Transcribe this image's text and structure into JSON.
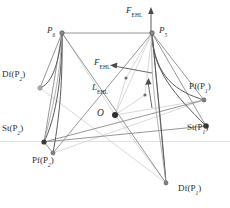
{
  "figure": {
    "type": "geometric-kinematic-diagram",
    "background": "#ffffff",
    "stroke_dark": "#4a4a4a",
    "stroke_mid": "#7d7d7d",
    "stroke_light": "#b9b9b9",
    "stroke_faint": "#d8d8d8",
    "node_fill": "#3b3b3b",
    "node_fill_light": "#9a9a9a",
    "text_color": "#2e2e2e"
  },
  "labels": {
    "f_ehl_top": {
      "base": "F",
      "sub": "EHL",
      "x": 126,
      "y": 8
    },
    "f_ehl_center": {
      "base": "F",
      "sub": "EHL",
      "x": 95,
      "y": 60
    },
    "l_ehl": {
      "base": "L",
      "sub": "EHL",
      "x": 93,
      "y": 85
    },
    "origin": {
      "base": "O",
      "sub": "",
      "x": 98,
      "y": 111
    },
    "p6": {
      "base": "P",
      "sub": "6",
      "x": 48,
      "y": 29
    },
    "p5": {
      "base": "P",
      "sub": "5",
      "x": 160,
      "y": 29
    },
    "df_p2": {
      "base": "Df(P",
      "sub": "2",
      "tail": ")",
      "x": 3,
      "y": 73
    },
    "st_p2": {
      "base": "St(P",
      "sub": "2",
      "tail": ")",
      "x": 3,
      "y": 127
    },
    "pf_p2": {
      "base": "Pf(P",
      "sub": "2",
      "tail": ")",
      "x": 33,
      "y": 158
    },
    "pf_p1": {
      "base": "Pf(P",
      "sub": "1",
      "tail": ")",
      "x": 190,
      "y": 84
    },
    "st_p1": {
      "base": "St(P",
      "sub": "1",
      "tail": ")",
      "x": 188,
      "y": 125
    },
    "df_p1": {
      "base": "Df(P",
      "sub": "1",
      "tail": ")",
      "x": 179,
      "y": 186
    }
  },
  "nodes": [
    {
      "name": "node-p6",
      "x": 62,
      "y": 33,
      "r": 2.2,
      "style": "dark"
    },
    {
      "name": "node-p5",
      "x": 152,
      "y": 33,
      "r": 2.2,
      "style": "dark"
    },
    {
      "name": "node-df-p2",
      "x": 40,
      "y": 88,
      "r": 2.2,
      "style": "light"
    },
    {
      "name": "node-st-p2",
      "x": 44,
      "y": 142,
      "r": 2.6,
      "style": "dark"
    },
    {
      "name": "node-pf-p2",
      "x": 53,
      "y": 153,
      "r": 2.4,
      "style": "mid"
    },
    {
      "name": "node-pf-p1",
      "x": 204,
      "y": 100,
      "r": 2.4,
      "style": "mid"
    },
    {
      "name": "node-st-p1",
      "x": 206,
      "y": 126,
      "r": 2.8,
      "style": "dark"
    },
    {
      "name": "node-df-p1",
      "x": 166,
      "y": 183,
      "r": 2.4,
      "style": "mid"
    },
    {
      "name": "node-origin",
      "x": 115,
      "y": 115,
      "r": 3.0,
      "style": "dark"
    },
    {
      "name": "node-mid-a",
      "x": 126,
      "y": 78,
      "r": 1.8,
      "style": "mid"
    },
    {
      "name": "node-mid-b",
      "x": 145,
      "y": 95,
      "r": 1.8,
      "style": "mid"
    }
  ],
  "axis_arrow": {
    "name": "f-ehl-axis-arrow",
    "x": 151,
    "y_top": 10,
    "y_bottom": 33
  },
  "baseline": {
    "name": "horizon-line",
    "y": 141,
    "x1": 0,
    "x2": 230
  }
}
